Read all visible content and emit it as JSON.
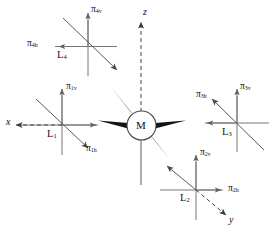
{
  "figure": {
    "kind": "vector-diagram",
    "background_color": "#ffffff",
    "line_color": "#6f6f6f",
    "ink_color": "#111111",
    "spike_color": "#111111"
  },
  "center": {
    "label": "M",
    "name": "mass-node"
  },
  "global_axes": [
    {
      "id": "z",
      "label": "z",
      "style": "dashed",
      "direction": "up"
    },
    {
      "id": "x",
      "label": "x",
      "style": "dashed",
      "direction": "left"
    },
    {
      "id": "y",
      "label": "y",
      "style": "dashed",
      "direction": "down-right"
    }
  ],
  "frames": [
    {
      "id": "L1",
      "label": "L",
      "sub": "1",
      "vertical_label": "π",
      "vertical_sub": "1v",
      "horizontal_label": "π",
      "horizontal_sub": "1h"
    },
    {
      "id": "L2",
      "label": "L",
      "sub": "2",
      "vertical_label": "π",
      "vertical_sub": "2v",
      "horizontal_label": "π",
      "horizontal_sub": "2h"
    },
    {
      "id": "L3",
      "label": "L",
      "sub": "3",
      "vertical_label": "π",
      "vertical_sub": "3v",
      "horizontal_label": "π",
      "horizontal_sub": "3h"
    },
    {
      "id": "L4",
      "label": "L",
      "sub": "4",
      "vertical_label": "π",
      "vertical_sub": "4v",
      "horizontal_label": "π",
      "horizontal_sub": "4h"
    }
  ],
  "labels": {
    "pi": "π",
    "L": "L",
    "M": "M",
    "x": "x",
    "y": "y",
    "z": "z",
    "pi1v_sub": "1v",
    "pi1h_sub": "1h",
    "pi2v_sub": "2v",
    "pi2h_sub": "2h",
    "pi3v_sub": "3v",
    "pi3h_sub": "3h",
    "pi4v_sub": "4v",
    "pi4h_sub": "4h",
    "L1_sub": "1",
    "L2_sub": "2",
    "L3_sub": "3",
    "L4_sub": "4"
  }
}
